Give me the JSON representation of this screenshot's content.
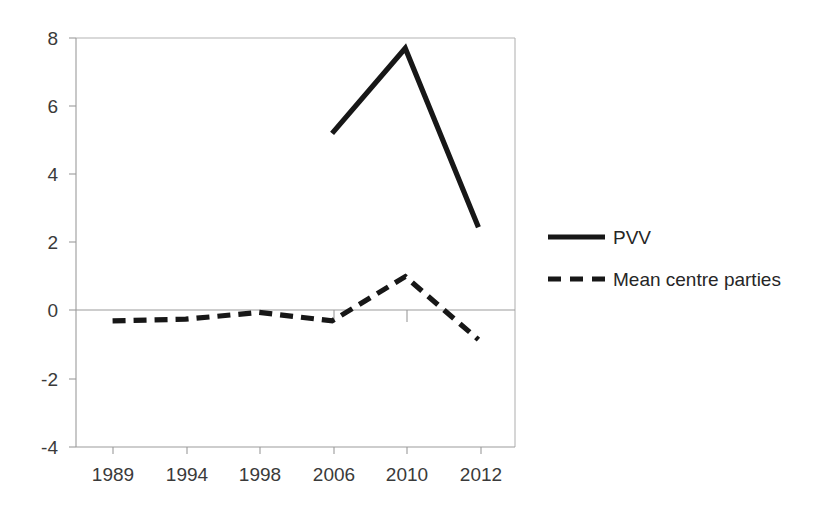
{
  "chart_data": {
    "type": "line",
    "title": "",
    "xlabel": "",
    "ylabel": "",
    "categories": [
      "1989",
      "1994",
      "1998",
      "2006",
      "2010",
      "2012"
    ],
    "series": [
      {
        "name": "PVV",
        "style": "solid",
        "color": "#171717",
        "values": [
          null,
          null,
          null,
          5.2,
          7.7,
          2.45
        ]
      },
      {
        "name": "Mean centre parties",
        "style": "dashed",
        "color": "#171717",
        "values": [
          -0.3,
          -0.25,
          -0.05,
          -0.3,
          1.0,
          -0.85
        ]
      }
    ],
    "ylim": [
      -4,
      8
    ],
    "yticks": [
      "8",
      "6",
      "4",
      "2",
      "0",
      "-2",
      "-4"
    ],
    "ytick_values": [
      8,
      6,
      4,
      2,
      0,
      -2,
      -4
    ],
    "grid": false,
    "legend_position": "right",
    "zero_line": 0
  },
  "axes": {
    "y_tick_labels": [
      "8",
      "6",
      "4",
      "2",
      "0",
      "-2",
      "-4"
    ],
    "x_tick_labels": [
      "1989",
      "1994",
      "1998",
      "2006",
      "2010",
      "2012"
    ]
  },
  "legend": {
    "items": [
      {
        "label": "PVV",
        "style": "solid"
      },
      {
        "label": "Mean centre parties",
        "style": "dashed"
      }
    ]
  },
  "colors": {
    "series": "#171717",
    "axis": "#9b9b9b",
    "frame": "#b4b4b4",
    "text": "#262626",
    "background": "#ffffff"
  }
}
